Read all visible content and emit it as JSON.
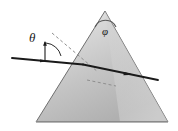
{
  "figure": {
    "kind": "optics-prism-refraction-diagram",
    "background_color": "#ffffff",
    "width": 178,
    "height": 131
  },
  "prism": {
    "name": "triangular-prism",
    "apex": {
      "x": 105,
      "y": 11
    },
    "bottom_left": {
      "x": 36,
      "y": 122
    },
    "bottom_right": {
      "x": 168,
      "y": 122
    },
    "fill_light": "#e9e9e9",
    "fill_mid": "#c9c9c9",
    "fill_dark": "#a8a8a8",
    "stroke_color": "#6f6f6f",
    "stroke_width": 1
  },
  "labels": {
    "theta": "θ",
    "phi": "φ"
  },
  "rays": {
    "color": "#1a1a1a",
    "incident": {
      "name": "incident-ray",
      "from": {
        "x": 12,
        "y": 58
      },
      "to": {
        "x": 82,
        "y": 64
      },
      "arrow_at": {
        "x": 44,
        "y": 60
      }
    },
    "internal": {
      "name": "internal-refracted-ray",
      "from": {
        "x": 82,
        "y": 64
      },
      "to": {
        "x": 146,
        "y": 77
      }
    },
    "emergent": {
      "name": "emergent-ray",
      "from": {
        "x": 146,
        "y": 77
      },
      "to": {
        "x": 158,
        "y": 80
      },
      "arrow_at": {
        "x": 130,
        "y": 74
      }
    }
  },
  "normals": {
    "color": "#8a8a8a",
    "dash": "3 2.5",
    "entry_normal": {
      "name": "entry-surface-normal-dashed",
      "from": {
        "x": 52,
        "y": 33
      },
      "to": {
        "x": 98,
        "y": 72
      }
    },
    "internal_normal": {
      "name": "internal-surface-normal-dashed",
      "from": {
        "x": 87,
        "y": 80
      },
      "to": {
        "x": 116,
        "y": 86
      }
    }
  },
  "angle_marks": {
    "theta_arc": {
      "name": "theta-angle-arc",
      "vertex": {
        "x": 45,
        "y": 60
      },
      "radius": 18
    },
    "theta_tick": {
      "name": "theta-normal-tick",
      "from": {
        "x": 45,
        "y": 41
      },
      "to": {
        "x": 45,
        "y": 61
      }
    },
    "phi_arc": {
      "name": "apex-angle-arc",
      "center": {
        "x": 105,
        "y": 22
      },
      "radius": 11
    }
  }
}
